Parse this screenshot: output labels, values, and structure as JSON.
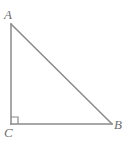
{
  "figure": {
    "canvas": {
      "width": 129,
      "height": 146,
      "background": "#ffffff"
    },
    "style": {
      "stroke_color": "#8a8a8a",
      "stroke_width": 1.5,
      "label_color": "#6f6f6f",
      "label_font_size": 13,
      "label_font_style": "italic"
    },
    "vertices": [
      {
        "name": "A",
        "label": "A",
        "x": 11,
        "y": 24,
        "label_x": 4,
        "label_y": 8
      },
      {
        "name": "B",
        "label": "B",
        "x": 112,
        "y": 124,
        "label_x": 114,
        "label_y": 118
      },
      {
        "name": "C",
        "label": "C",
        "x": 11,
        "y": 124,
        "label_x": 4,
        "label_y": 126
      }
    ],
    "sides": [
      {
        "name": "AC",
        "from": "A",
        "to": "C",
        "role": "vertical-leg"
      },
      {
        "name": "CB",
        "from": "C",
        "to": "B",
        "role": "horizontal-leg"
      },
      {
        "name": "AB",
        "from": "A",
        "to": "B",
        "role": "hypotenuse"
      }
    ],
    "right_angle": {
      "at_vertex": "C",
      "marker": "square",
      "size": 7,
      "x": 11,
      "y": 124
    }
  }
}
